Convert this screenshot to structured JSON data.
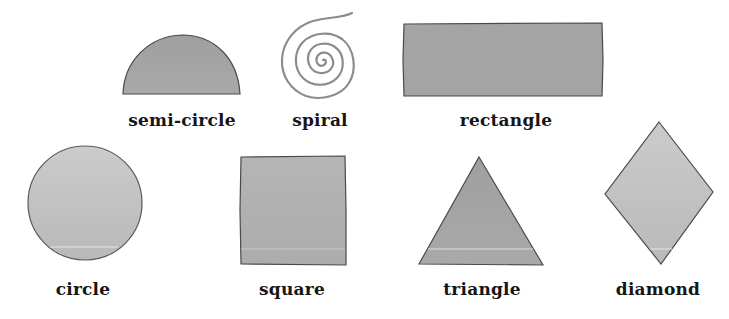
{
  "colors": {
    "background": "#ffffff",
    "fill_dark": "#a3a3a3",
    "fill_light": "#c2c2c2",
    "outline": "#4a4a4a",
    "spiral_stroke": "#8c8c8c",
    "label_text": "#161616"
  },
  "shapes": [
    {
      "id": "semi-circle",
      "label": "semi-circle"
    },
    {
      "id": "spiral",
      "label": "spiral"
    },
    {
      "id": "rectangle",
      "label": "rectangle"
    },
    {
      "id": "circle",
      "label": "circle"
    },
    {
      "id": "square",
      "label": "square"
    },
    {
      "id": "triangle",
      "label": "triangle"
    },
    {
      "id": "diamond",
      "label": "diamond"
    }
  ]
}
